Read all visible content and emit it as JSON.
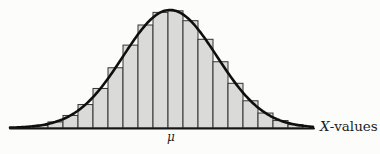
{
  "figure": {
    "background": "#fcfcfb"
  },
  "chart_data": {
    "type": "bar",
    "subtype": "histogram-with-normal-curve-overlay",
    "title": "",
    "xlabel": "X-values",
    "xlabel_prefix": "X",
    "xlabel_suffix": "-values",
    "ylabel": "",
    "mu_label": "μ",
    "categories": [
      1,
      2,
      3,
      4,
      5,
      6,
      7,
      8,
      9,
      10,
      11,
      12,
      13,
      14,
      15,
      16,
      17,
      18
    ],
    "values": [
      0.0225,
      0.0515,
      0.1063,
      0.1986,
      0.3351,
      0.5105,
      0.7025,
      0.8729,
      0.9798,
      0.9932,
      0.9093,
      0.7518,
      0.5615,
      0.3787,
      0.2307,
      0.1268,
      0.063,
      0.0283
    ],
    "ylim": [
      0,
      1
    ],
    "grid": "off",
    "legend": "none",
    "colors": {
      "bar_fill": "#dadad8",
      "bar_stroke": "#333333",
      "curve": "#0f0f0f",
      "axis_line": "#161616",
      "text": "#1c1c1c"
    },
    "layout": {
      "width": 380,
      "height": 154,
      "plot_left": 33,
      "bar_width": 15,
      "baseline_y": 128,
      "peak_height_px": 118,
      "gauss_mu_x": 170,
      "gauss_sigma_x": 47,
      "curve_x_start": 10,
      "curve_x_end": 314,
      "mu_label_x": 171,
      "mu_label_y": 141,
      "xlabel_x": 320,
      "xlabel_y": 131
    }
  }
}
